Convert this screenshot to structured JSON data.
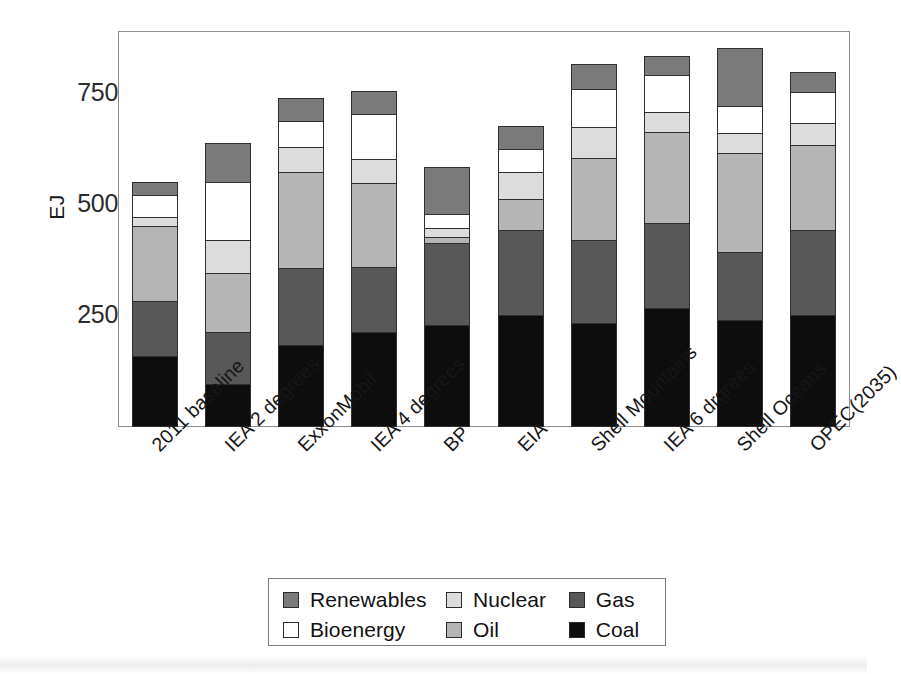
{
  "chart_data": {
    "type": "bar",
    "stacked": true,
    "title": "",
    "xlabel": "",
    "ylabel": "EJ",
    "ylim": [
      0,
      890
    ],
    "yticks": [
      250,
      500,
      750
    ],
    "ytick_labels": [
      "250",
      "500",
      "750"
    ],
    "grid": false,
    "legend_position": "bottom",
    "categories": [
      "2011 baseline",
      "IEA 2 degrees",
      "ExxonMobil",
      "IEA 4 degrees",
      "BP",
      "EIA",
      "Shell Mountains",
      "IEA 6 drgrees",
      "Shell Oceans",
      "OPEC(2035)"
    ],
    "series": [
      {
        "name": "Coal",
        "color": "#0d0d0d",
        "values": [
          160,
          97,
          185,
          214,
          230,
          252,
          234,
          268,
          241,
          252
        ]
      },
      {
        "name": "Gas",
        "color": "#585858",
        "values": [
          123,
          117,
          173,
          146,
          184,
          191,
          186,
          191,
          153,
          191
        ]
      },
      {
        "name": "Oil",
        "color": "#b5b5b5",
        "values": [
          169,
          133,
          216,
          189,
          14,
          70,
          185,
          205,
          223,
          190
        ]
      },
      {
        "name": "Nuclear",
        "color": "#dcdcdc",
        "values": [
          20,
          73,
          56,
          54,
          20,
          60,
          70,
          45,
          44,
          51
        ]
      },
      {
        "name": "Bioenergy",
        "color": "#ffffff",
        "values": [
          50,
          131,
          58,
          101,
          30,
          52,
          85,
          83,
          61,
          70
        ]
      },
      {
        "name": "Renewables",
        "color": "#7a7a7a",
        "values": [
          29,
          88,
          52,
          52,
          106,
          52,
          57,
          43,
          131,
          43
        ]
      }
    ],
    "totals": [
      551,
      639,
      740,
      756,
      584,
      677,
      817,
      835,
      853,
      797
    ]
  },
  "axis": {
    "y_title": "EJ",
    "y_tick_labels": [
      "750",
      "500",
      "250"
    ]
  },
  "legend": {
    "rows": [
      [
        {
          "label": "Renewables",
          "color": "#7a7a7a",
          "swatch": "renewables-swatch"
        },
        {
          "label": "Nuclear",
          "color": "#dcdcdc",
          "swatch": "nuclear-swatch"
        },
        {
          "label": "Gas",
          "color": "#585858",
          "swatch": "gas-swatch"
        }
      ],
      [
        {
          "label": "Bioenergy",
          "color": "#ffffff",
          "swatch": "bioenergy-swatch"
        },
        {
          "label": "Oil",
          "color": "#b5b5b5",
          "swatch": "oil-swatch"
        },
        {
          "label": "Coal",
          "color": "#0d0d0d",
          "swatch": "coal-swatch"
        }
      ]
    ]
  }
}
